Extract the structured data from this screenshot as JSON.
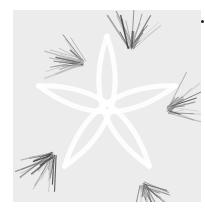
{
  "artwork": {
    "kind": "generative-line-art",
    "symmetry": 5,
    "colors": {
      "background": "#ffffff",
      "canvas": "#ececec",
      "arc": "#ffffff",
      "stroke_dark": "#3a3a3a",
      "stroke_mid": "#7a7a7a",
      "stroke_light": "#b5b5b5",
      "dot": "#222222"
    },
    "bursts": [
      {
        "cx": 70,
        "cy": 52,
        "angle": 200
      },
      {
        "cx": 155,
        "cy": 100,
        "angle": -20
      },
      {
        "cx": 130,
        "cy": 175,
        "angle": 60
      },
      {
        "cx": 40,
        "cy": 145,
        "angle": 130
      },
      {
        "cx": 118,
        "cy": 38,
        "angle": -80
      }
    ]
  }
}
